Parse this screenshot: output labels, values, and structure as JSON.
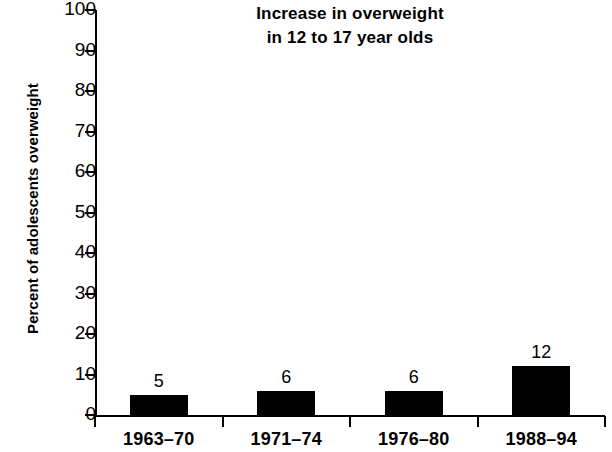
{
  "chart_data": {
    "type": "bar",
    "title": "Increase in overweight in 12 to 17 year olds",
    "title_line1": "Increase in overweight",
    "title_line2": "in 12 to 17 year olds",
    "xlabel": "",
    "ylabel": "Percent of adolescents overweight",
    "categories": [
      "1963–70",
      "1971–74",
      "1976–80",
      "1988–94"
    ],
    "values": [
      5,
      6,
      6,
      12
    ],
    "value_labels": [
      "5",
      "6",
      "6",
      "12"
    ],
    "ylim": [
      0,
      100
    ],
    "ytick_labels": [
      "100",
      "90",
      "80",
      "70",
      "60",
      "50",
      "40",
      "30",
      "20",
      "10",
      "0"
    ],
    "ytick_values": [
      100,
      90,
      80,
      70,
      60,
      50,
      40,
      30,
      20,
      10,
      0
    ],
    "grid": false,
    "legend": false,
    "bar_color": "#000000",
    "axis_color": "#000000",
    "background_color": "#ffffff"
  }
}
